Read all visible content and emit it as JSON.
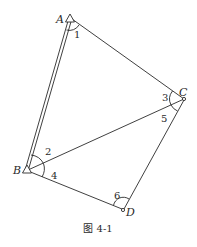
{
  "figure": {
    "caption": "图 4-1",
    "line_color": "#2a2a2a",
    "vertices": {
      "A": {
        "label": "A",
        "x": 70,
        "y": 19,
        "marker": "triangle"
      },
      "B": {
        "label": "B",
        "x": 27,
        "y": 170,
        "marker": "triangle"
      },
      "C": {
        "label": "C",
        "x": 184,
        "y": 99,
        "marker": "circle"
      },
      "D": {
        "label": "D",
        "x": 123,
        "y": 210,
        "marker": "circle"
      }
    },
    "edges": [
      {
        "from": "A",
        "to": "B",
        "style": "double"
      },
      {
        "from": "A",
        "to": "C",
        "style": "single"
      },
      {
        "from": "B",
        "to": "C",
        "style": "single"
      },
      {
        "from": "B",
        "to": "D",
        "style": "single"
      },
      {
        "from": "C",
        "to": "D",
        "style": "single"
      }
    ],
    "angles": [
      {
        "label": "1",
        "vertex": "A"
      },
      {
        "label": "2",
        "vertex": "B"
      },
      {
        "label": "3",
        "vertex": "C"
      },
      {
        "label": "4",
        "vertex": "B"
      },
      {
        "label": "5",
        "vertex": "C"
      },
      {
        "label": "6",
        "vertex": "D"
      }
    ]
  }
}
